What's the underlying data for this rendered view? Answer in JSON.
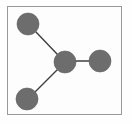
{
  "figure": {
    "title": "",
    "background_color": "#fefefe",
    "frame": {
      "stroke_color": "#9a9a9a",
      "fill_color": "#fdfdfd",
      "stroke_width": 1,
      "x": 7,
      "y": 6,
      "width": 115,
      "height": 109
    }
  },
  "chart_data": {
    "type": "diagram",
    "diagram_kind": "node-link-graph",
    "title": "",
    "xlabel": "",
    "ylabel": "",
    "grid": false,
    "legend": "none",
    "node_style": {
      "fill_color": "#6d6d6d",
      "stroke_color": "#5f5f5f",
      "radius": 11
    },
    "edge_style": {
      "stroke_color": "#3f3f3f",
      "stroke_width": 1.4
    },
    "nodes": [
      {
        "id": "n1",
        "label": "",
        "x": 28,
        "y": 24,
        "r": 11
      },
      {
        "id": "n2",
        "label": "",
        "x": 65,
        "y": 62,
        "r": 11
      },
      {
        "id": "n3",
        "label": "",
        "x": 100,
        "y": 61,
        "r": 11
      },
      {
        "id": "n4",
        "label": "",
        "x": 27,
        "y": 99,
        "r": 11
      }
    ],
    "edges": [
      {
        "source": "n1",
        "target": "n2",
        "x1": 36,
        "y1": 32,
        "x2": 57,
        "y2": 54
      },
      {
        "source": "n2",
        "target": "n3",
        "x1": 76,
        "y1": 61,
        "x2": 89,
        "y2": 61
      },
      {
        "source": "n2",
        "target": "n4",
        "x1": 57,
        "y1": 70,
        "x2": 35,
        "y2": 92
      }
    ],
    "node_count": 4,
    "edge_count": 3
  }
}
